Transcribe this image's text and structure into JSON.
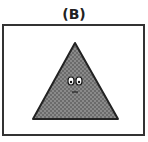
{
  "panel": {
    "label": "(B)",
    "shape": "triangle",
    "fill_color": "#7a7a7a",
    "outline_color": "#222222",
    "face": "eyes-and-mouth"
  }
}
